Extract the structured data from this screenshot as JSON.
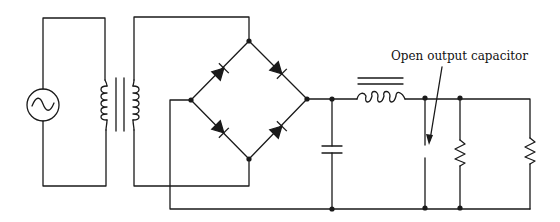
{
  "diagram": {
    "type": "circuit-schematic",
    "annotation": {
      "text": "Open output capacitor",
      "target": "output-capacitor-open"
    },
    "components": [
      {
        "id": "ac-source",
        "kind": "AC voltage source"
      },
      {
        "id": "transformer",
        "kind": "iron-core transformer",
        "windings": [
          "primary",
          "secondary"
        ]
      },
      {
        "id": "bridge-rectifier",
        "kind": "diode bridge",
        "diodes": 4
      },
      {
        "id": "input-capacitor",
        "kind": "filter capacitor"
      },
      {
        "id": "filter-inductor",
        "kind": "iron-core choke"
      },
      {
        "id": "output-capacitor",
        "kind": "capacitor",
        "state": "open"
      },
      {
        "id": "bleeder-resistor",
        "kind": "resistor"
      },
      {
        "id": "load-resistor",
        "kind": "resistor"
      }
    ],
    "colors": {
      "line": "#1a1a1a",
      "background": "#ffffff"
    }
  }
}
